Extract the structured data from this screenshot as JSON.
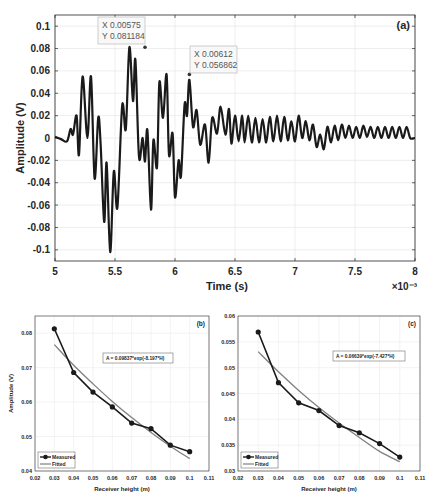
{
  "chart_data": [
    {
      "id": "a",
      "type": "line",
      "panel_label": "(a)",
      "xlabel": "Time (s)",
      "ylabel": "Amplitude (V)",
      "x_exponent_label": "×10⁻³",
      "xlim": [
        5,
        8
      ],
      "ylim": [
        -0.11,
        0.11
      ],
      "xticks": [
        "5",
        "5.5",
        "6",
        "6.5",
        "7",
        "7.5",
        "8"
      ],
      "yticks": [
        "0.1",
        "0.08",
        "0.06",
        "0.04",
        "0.02",
        "0",
        "-0.02",
        "-0.04",
        "-0.06",
        "-0.08",
        "-0.1"
      ],
      "grid": true,
      "datatips": [
        {
          "x_label": "X 0.00575",
          "y_label": "Y 0.081184",
          "x": 5.75,
          "y": 0.081184
        },
        {
          "x_label": "X 0.00612",
          "y_label": "Y 0.056862",
          "x": 6.12,
          "y": 0.056862
        }
      ],
      "series": [
        {
          "name": "signal",
          "x": [
            5.0,
            5.05,
            5.1,
            5.13,
            5.15,
            5.18,
            5.2,
            5.23,
            5.27,
            5.3,
            5.33,
            5.36,
            5.38,
            5.41,
            5.43,
            5.46,
            5.49,
            5.52,
            5.56,
            5.59,
            5.62,
            5.65,
            5.67,
            5.7,
            5.73,
            5.75,
            5.77,
            5.8,
            5.82,
            5.85,
            5.87,
            5.9,
            5.93,
            5.95,
            5.98,
            6.0,
            6.03,
            6.05,
            6.08,
            6.1,
            6.12,
            6.15,
            6.18,
            6.21,
            6.25,
            6.28,
            6.31,
            6.35,
            6.38,
            6.42,
            6.45,
            6.47,
            6.5,
            6.53,
            6.56,
            6.58,
            6.61,
            6.64,
            6.67,
            6.7,
            6.73,
            6.76,
            6.79,
            6.82,
            6.85,
            6.88,
            6.91,
            6.94,
            6.97,
            7.0,
            7.03,
            7.06,
            7.09,
            7.12,
            7.15,
            7.18,
            7.21,
            7.24,
            7.27,
            7.3,
            7.33,
            7.36,
            7.39,
            7.42,
            7.45,
            7.48,
            7.51,
            7.54,
            7.57,
            7.6,
            7.63,
            7.66,
            7.69,
            7.72,
            7.75,
            7.78,
            7.81,
            7.84,
            7.87,
            7.9,
            7.93,
            7.96,
            8.0
          ],
          "y": [
            0.001,
            -0.001,
            -0.003,
            0.008,
            0.003,
            0.02,
            -0.015,
            0.055,
            0.0,
            0.055,
            -0.036,
            0.018,
            -0.005,
            -0.075,
            -0.022,
            -0.102,
            -0.03,
            -0.062,
            0.029,
            0.008,
            0.081184,
            0.033,
            0.07,
            -0.017,
            0.0,
            -0.021,
            0.007,
            -0.064,
            -0.002,
            -0.026,
            0.05,
            0.018,
            0.056862,
            -0.015,
            0.004,
            -0.053,
            -0.02,
            -0.034,
            0.03,
            0.02,
            0.052,
            0.01,
            0.025,
            -0.006,
            0.012,
            -0.022,
            0.018,
            0.004,
            0.028,
            0.003,
            0.026,
            -0.005,
            0.02,
            -0.003,
            0.02,
            -0.004,
            0.02,
            -0.004,
            0.018,
            -0.004,
            0.017,
            -0.004,
            0.019,
            -0.003,
            0.02,
            -0.003,
            0.019,
            -0.002,
            0.015,
            -0.003,
            0.02,
            0.0,
            0.015,
            -0.002,
            0.012,
            -0.008,
            0.003,
            -0.01,
            0.01,
            -0.004,
            0.011,
            -0.002,
            0.012,
            0.0,
            0.011,
            0.0,
            0.01,
            0.0,
            0.011,
            0.001,
            0.01,
            0.0,
            0.01,
            0.0,
            0.01,
            0.0,
            0.01,
            0.0,
            0.01,
            0.0,
            0.01,
            0.0,
            0.0
          ]
        }
      ]
    },
    {
      "id": "b",
      "type": "line",
      "panel_label": "(b)",
      "xlabel": "Receiver height (m)",
      "ylabel": "Amplitude (V)",
      "xlim": [
        0.02,
        0.11
      ],
      "ylim": [
        0.04,
        0.085
      ],
      "xticks": [
        "0.02",
        "0.03",
        "0.04",
        "0.05",
        "0.06",
        "0.07",
        "0.08",
        "0.09",
        "0.1",
        "0.11"
      ],
      "yticks": [
        "0.08",
        "0.07",
        "0.06",
        "0.05",
        "0.04"
      ],
      "grid": true,
      "annotation": "A = 0.09837*exp(-8.197*H)",
      "legend": [
        "Measured",
        "Fitted"
      ],
      "legend_position": "lower left",
      "series": [
        {
          "name": "Measured",
          "x": [
            0.03,
            0.04,
            0.05,
            0.06,
            0.07,
            0.08,
            0.09,
            0.1
          ],
          "y": [
            0.0813,
            0.0686,
            0.0629,
            0.0586,
            0.0539,
            0.0523,
            0.0475,
            0.0456
          ]
        },
        {
          "name": "Fitted",
          "x": [
            0.03,
            0.04,
            0.05,
            0.06,
            0.07,
            0.08,
            0.09,
            0.1
          ],
          "y": [
            0.0767,
            0.0707,
            0.0653,
            0.0602,
            0.0555,
            0.0512,
            0.0472,
            0.0436
          ]
        }
      ]
    },
    {
      "id": "c",
      "type": "line",
      "panel_label": "(c)",
      "xlabel": "Receiver height (m)",
      "ylabel": "",
      "xlim": [
        0.02,
        0.11
      ],
      "ylim": [
        0.03,
        0.06
      ],
      "xticks": [
        "0.02",
        "0.03",
        "0.04",
        "0.05",
        "0.06",
        "0.07",
        "0.08",
        "0.09",
        "0.1",
        "0.11"
      ],
      "yticks": [
        "0.06",
        "0.055",
        "0.05",
        "0.045",
        "0.04",
        "0.035",
        "0.03"
      ],
      "grid": true,
      "annotation": "A = 0.06639*exp(-7.427*H)",
      "legend": [
        "Measured",
        "Fitted"
      ],
      "legend_position": "lower left",
      "series": [
        {
          "name": "Measured",
          "x": [
            0.03,
            0.04,
            0.05,
            0.06,
            0.07,
            0.08,
            0.09,
            0.1
          ],
          "y": [
            0.0569,
            0.0471,
            0.0432,
            0.0417,
            0.0388,
            0.0374,
            0.0353,
            0.0327
          ]
        },
        {
          "name": "Fitted",
          "x": [
            0.03,
            0.04,
            0.05,
            0.06,
            0.07,
            0.08,
            0.09,
            0.1
          ],
          "y": [
            0.0531,
            0.0492,
            0.0456,
            0.0423,
            0.0393,
            0.0365,
            0.0338,
            0.0318
          ]
        }
      ]
    }
  ],
  "colors": {
    "line": "#1a1a1a",
    "fitted": "#808080",
    "grid": "#e6e6e6",
    "axis": "#262626",
    "datatip_border": "#bbbbbb",
    "datatip_bg": "#f7f7f7"
  }
}
